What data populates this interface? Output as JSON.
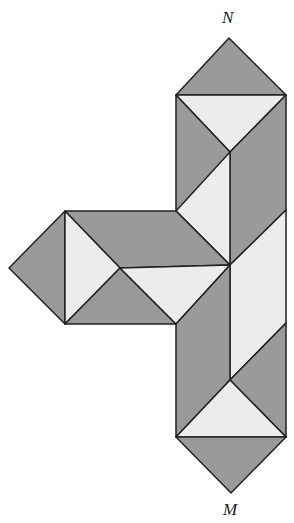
{
  "labels": {
    "top": "N",
    "bottom": "M"
  },
  "colors": {
    "dark": "#9a9a9a",
    "light": "#ececec",
    "stroke": "#222222"
  }
}
